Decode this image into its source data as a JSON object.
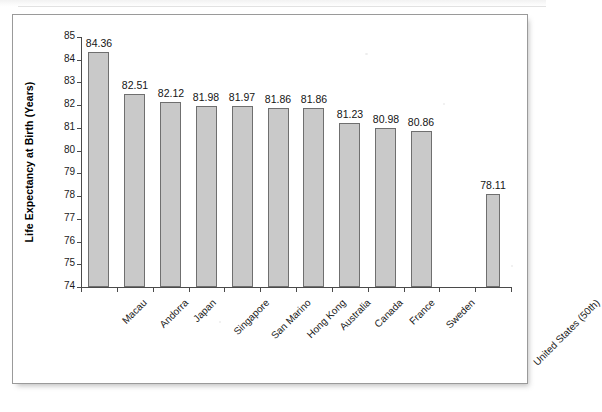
{
  "figure": {
    "panel_name": "chart-figure-panel",
    "background": "#ffffff",
    "border_color": "#9a9a9a"
  },
  "style": {
    "bar_fill": "#c9c9c9",
    "bar_border": "#6f6f6f",
    "axis_color": "#4a4a4a",
    "text_color": "#1a1a1a"
  },
  "chart_data": {
    "type": "bar",
    "title": "",
    "subtitle": "",
    "xlabel": "",
    "ylabel": "Life Expectancy at Birth (Years)",
    "ylim": [
      74,
      85
    ],
    "ytick_step": 1,
    "yticks": [
      "85",
      "84",
      "83",
      "82",
      "81",
      "80",
      "79",
      "78",
      "77",
      "76",
      "75",
      "74"
    ],
    "grid": false,
    "legend": false,
    "legend_position": "none",
    "categories": [
      "Macau",
      "Andorra",
      "Japan",
      "Singapore",
      "San Marino",
      "Hong Kong",
      "Australia",
      "Canada",
      "France",
      "Sweden",
      "",
      "United States (50th)"
    ],
    "values": [
      84.36,
      82.51,
      82.12,
      81.98,
      81.97,
      81.86,
      81.86,
      81.23,
      80.98,
      80.86,
      null,
      78.11
    ],
    "value_labels": [
      "84.36",
      "82.51",
      "82.12",
      "81.98",
      "81.97",
      "81.86",
      "81.86",
      "81.23",
      "80.98",
      "80.86",
      "",
      "78.11"
    ]
  }
}
